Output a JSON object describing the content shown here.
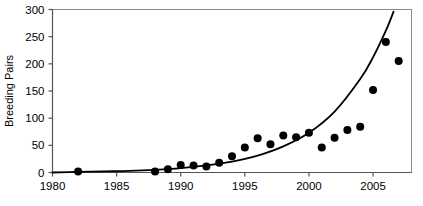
{
  "chart_data": {
    "type": "scatter",
    "title": "",
    "subtitle": "",
    "xlabel": "",
    "ylabel": "Breeding Pairs",
    "xlim": [
      1980,
      2008
    ],
    "ylim": [
      0,
      300
    ],
    "grid": false,
    "legend": false,
    "x_ticks": [
      1980,
      1985,
      1990,
      1995,
      2000,
      2005
    ],
    "x_tick_labels": [
      "1980",
      "1985",
      "1990",
      "1995",
      "2000",
      "2005"
    ],
    "y_ticks": [
      0,
      50,
      100,
      150,
      200,
      250,
      300
    ],
    "y_tick_labels": [
      "0",
      "50",
      "100",
      "150",
      "200",
      "250",
      "300"
    ],
    "marker": "filled-circle",
    "marker_color": "#000000",
    "series": [
      {
        "name": "Breeding Pairs",
        "type": "scatter",
        "x": [
          1982,
          1988,
          1989,
          1990,
          1991,
          1992,
          1993,
          1994,
          1995,
          1996,
          1997,
          1998,
          1999,
          2000,
          2001,
          2002,
          2003,
          2004,
          2005,
          2006,
          2007
        ],
        "values": [
          2,
          2,
          6,
          14,
          13,
          11,
          18,
          30,
          46,
          63,
          52,
          68,
          65,
          73,
          46,
          64,
          78,
          84,
          152,
          240,
          205
        ]
      },
      {
        "name": "Fitted exponential curve",
        "type": "line",
        "line_color": "#000000",
        "x": [
          1980,
          1982,
          1984,
          1986,
          1988,
          1990,
          1992,
          1994,
          1996,
          1998,
          2000,
          2002,
          2004,
          2005,
          2006,
          2006.6
        ],
        "values": [
          0,
          1,
          2,
          3,
          5,
          8,
          13,
          20,
          31,
          48,
          73,
          112,
          172,
          212,
          261,
          296
        ]
      }
    ]
  }
}
